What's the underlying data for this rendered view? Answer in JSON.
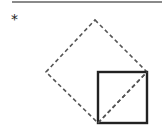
{
  "header": {
    "marker": "*"
  },
  "colors": {
    "rule": "#8a8a8a",
    "stroke": "#222222",
    "dashed": "#555555"
  },
  "diagram": {
    "dashed_diamond": {
      "top": [
        95,
        20
      ],
      "right": [
        147,
        72
      ],
      "bottom": [
        98,
        123
      ],
      "left": [
        46,
        72
      ]
    },
    "solid_square": {
      "x": 98,
      "y": 72,
      "width": 49,
      "height": 51
    },
    "dashed_diagonal": {
      "from": [
        98,
        123
      ],
      "to": [
        147,
        72
      ]
    }
  }
}
